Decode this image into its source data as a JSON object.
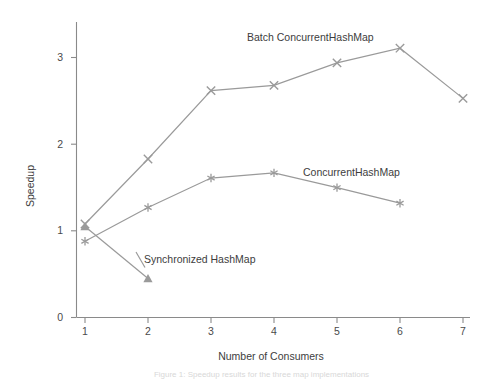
{
  "chart_data": {
    "type": "line",
    "title": "",
    "xlabel": "Number of Consumers",
    "ylabel": "Speedup",
    "x": [
      1,
      2,
      3,
      4,
      5,
      6,
      7
    ],
    "xticks": [
      "1",
      "2",
      "3",
      "4",
      "5",
      "6",
      "7"
    ],
    "yticks": [
      "0",
      "1",
      "2",
      "3"
    ],
    "xlim": [
      0.6,
      7.4
    ],
    "ylim": [
      0,
      3.45
    ],
    "grid": false,
    "legend": "inline-annotations",
    "series": [
      {
        "name": "Batch ConcurrentHashMap",
        "marker": "x",
        "x": [
          1,
          2,
          3,
          4,
          5,
          6,
          7
        ],
        "values": [
          1.08,
          1.83,
          2.62,
          2.68,
          2.94,
          3.11,
          2.53
        ]
      },
      {
        "name": "ConcurrentHashMap",
        "marker": "star",
        "x": [
          1,
          2,
          3,
          4,
          5,
          6
        ],
        "values": [
          0.88,
          1.27,
          1.61,
          1.67,
          1.5,
          1.32
        ]
      },
      {
        "name": "Synchronized HashMap",
        "marker": "triangle",
        "x": [
          1,
          2
        ],
        "values": [
          1.05,
          0.45
        ]
      }
    ],
    "annotations": [
      {
        "text": "Batch ConcurrentHashMap",
        "x": 247,
        "y": 41
      },
      {
        "text": "ConcurrentHashMap",
        "x": 303,
        "y": 176
      },
      {
        "text": "Synchronized HashMap",
        "x": 144,
        "y": 263
      }
    ]
  },
  "caption": {
    "text": "Figure 1: Speedup results for the three map implementations"
  }
}
